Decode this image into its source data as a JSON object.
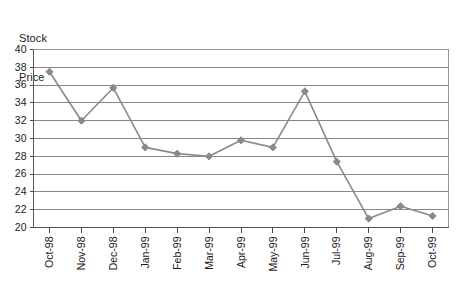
{
  "chart_data": {
    "type": "line",
    "title": "Stock Price",
    "title_lines": [
      "Stock",
      "Price"
    ],
    "xlabel": "",
    "ylabel": "Stock Price",
    "categories": [
      "Oct-98",
      "Nov-98",
      "Dec-98",
      "Jan-99",
      "Feb-99",
      "Mar-99",
      "Apr-99",
      "May-99",
      "Jun-99",
      "Jul-99",
      "Aug-99",
      "Sep-99",
      "Oct-99"
    ],
    "values": [
      37.5,
      32.0,
      35.7,
      29.0,
      28.3,
      28.0,
      29.8,
      29.0,
      35.3,
      27.4,
      21.0,
      22.4,
      21.3
    ],
    "series": [
      {
        "name": "Stock Price",
        "values": [
          37.5,
          32.0,
          35.7,
          29.0,
          28.3,
          28.0,
          29.8,
          29.0,
          35.3,
          27.4,
          21.0,
          22.4,
          21.3
        ]
      }
    ],
    "ylim": [
      20,
      40
    ],
    "ytick_step": 2,
    "ytick_labels": [
      "40",
      "38",
      "36",
      "34",
      "32",
      "30",
      "28",
      "26",
      "24",
      "22",
      "20"
    ],
    "ytick_values": [
      40,
      38,
      36,
      34,
      32,
      30,
      28,
      26,
      24,
      22,
      20
    ],
    "grid": true,
    "grid_axis": "y",
    "legend": false,
    "legend_position": "none",
    "marker": "diamond",
    "colors": {
      "series": "#8a8a8a",
      "gridline": "#7a7a7a",
      "axis": "#555555",
      "text": "#1a1a1a",
      "background": "#ffffff"
    },
    "xtick_label_rotation": -90
  }
}
